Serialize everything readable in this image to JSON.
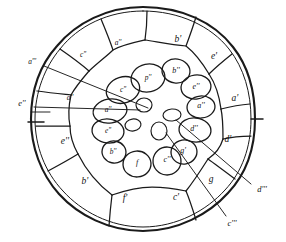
{
  "figure": {
    "background_color": "#ffffff",
    "ink_color": "#1a1a1a",
    "outer_circle": {
      "cx": 143,
      "cy": 119,
      "r": 112
    },
    "edge_tick_label": "right-edge-tick"
  },
  "outer_segments": [
    {
      "id": "seg-top-left-a",
      "label": "a''",
      "x": 118,
      "y": 43
    },
    {
      "id": "seg-top-b",
      "label": "b'",
      "x": 178,
      "y": 40
    },
    {
      "id": "seg-upper-left-c",
      "label": "c''",
      "x": 83,
      "y": 55
    },
    {
      "id": "seg-right-e",
      "label": "e'",
      "x": 214,
      "y": 57
    },
    {
      "id": "seg-right-a",
      "label": "a'",
      "x": 235,
      "y": 99
    },
    {
      "id": "seg-left-a",
      "label": "a''",
      "x": 70,
      "y": 98
    },
    {
      "id": "seg-right-d",
      "label": "d'",
      "x": 228,
      "y": 140
    },
    {
      "id": "seg-left-e",
      "label": "e''",
      "x": 65,
      "y": 142
    },
    {
      "id": "seg-lower-right-g",
      "label": "g",
      "x": 211,
      "y": 180
    },
    {
      "id": "seg-lower-left-b",
      "label": "b'",
      "x": 85,
      "y": 182
    },
    {
      "id": "seg-bottom-f",
      "label": "f'",
      "x": 125,
      "y": 199
    },
    {
      "id": "seg-bottom-c",
      "label": "c'",
      "x": 176,
      "y": 198
    }
  ],
  "inner_cells": [
    {
      "id": "cell-p",
      "label": "p''",
      "x": 148,
      "y": 78
    },
    {
      "id": "cell-b2",
      "label": "b''",
      "x": 176,
      "y": 71
    },
    {
      "id": "cell-c2",
      "label": "c''",
      "x": 123,
      "y": 90
    },
    {
      "id": "cell-e2",
      "label": "e''",
      "x": 196,
      "y": 87
    },
    {
      "id": "cell-a2",
      "label": "a''",
      "x": 201,
      "y": 105
    },
    {
      "id": "cell-a3",
      "label": "a''",
      "x": 108,
      "y": 110
    },
    {
      "id": "cell-d2",
      "label": "d''",
      "x": 193,
      "y": 128
    },
    {
      "id": "cell-e3",
      "label": "e''",
      "x": 108,
      "y": 131
    },
    {
      "id": "cell-g2",
      "label": "g'",
      "x": 183,
      "y": 151
    },
    {
      "id": "cell-b3",
      "label": "b''",
      "x": 113,
      "y": 152
    },
    {
      "id": "cell-f",
      "label": "f",
      "x": 137,
      "y": 163
    },
    {
      "id": "cell-c3",
      "label": "c''",
      "x": 167,
      "y": 160
    }
  ],
  "callouts": [
    {
      "id": "callout-a4",
      "label": "a'''",
      "x": 32,
      "y": 62
    },
    {
      "id": "callout-e4",
      "label": "e''",
      "x": 22,
      "y": 104
    },
    {
      "id": "callout-d4",
      "label": "d'''",
      "x": 262,
      "y": 190
    },
    {
      "id": "callout-c4",
      "label": "c'''",
      "x": 232,
      "y": 224
    }
  ]
}
